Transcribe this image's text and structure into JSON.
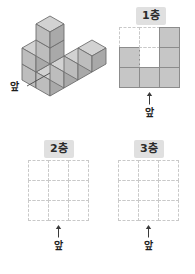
{
  "background_color": "#ffffff",
  "palette": {
    "cube_top": "#d2d2d2",
    "cube_left": "#bdbdbd",
    "cube_right": "#a9a9a9",
    "cube_outline": "#6e6e6e",
    "cell_fill": "#c6c6c6",
    "cell_border": "#8c8c8c",
    "grid_dash": "#c9c9c9",
    "chip_bg": "#e0e0e0",
    "text": "#1d1d1d"
  },
  "solid_figure": {
    "caption": "앞",
    "description_cells": 8
  },
  "panels": [
    {
      "id": "layer-1",
      "label": "1층",
      "front_caption": "앞",
      "rows": 3,
      "cols": 3,
      "filled": [
        [
          0,
          0,
          1
        ],
        [
          1,
          0,
          1
        ],
        [
          1,
          1,
          1
        ]
      ]
    },
    {
      "id": "layer-2",
      "label": "2층",
      "front_caption": "앞",
      "rows": 3,
      "cols": 3,
      "filled": [
        [
          0,
          0,
          0
        ],
        [
          0,
          0,
          0
        ],
        [
          0,
          0,
          0
        ]
      ]
    },
    {
      "id": "layer-3",
      "label": "3층",
      "front_caption": "앞",
      "rows": 3,
      "cols": 3,
      "filled": [
        [
          0,
          0,
          0
        ],
        [
          0,
          0,
          0
        ],
        [
          0,
          0,
          0
        ]
      ]
    }
  ]
}
